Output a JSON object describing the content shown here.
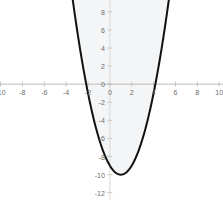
{
  "chart_data": {
    "type": "line",
    "title": "",
    "subtitle": "",
    "xlabel": "",
    "ylabel": "",
    "grid": false,
    "legend": false,
    "legend_position": "none",
    "xlim": [
      -10.05,
      10.35
    ],
    "ylim": [
      -12.8,
      9.3
    ],
    "x_ticks": [
      -10,
      -8,
      -6,
      -4,
      -2,
      0,
      2,
      4,
      6,
      8,
      10
    ],
    "x_tick_labels": [
      "-10",
      "-8",
      "-6",
      "-4",
      "-2",
      "0",
      "2",
      "4",
      "6",
      "8",
      "10"
    ],
    "y_ticks": [
      8,
      6,
      4,
      2,
      0,
      -2,
      -4,
      -6,
      -8,
      -10,
      -12
    ],
    "y_tick_labels": [
      "8",
      "6",
      "4",
      "2",
      "0",
      "-2",
      "-4",
      "-6",
      "-8",
      "-10",
      "-12"
    ],
    "series": [
      {
        "name": "parabola",
        "equation": "y = x^2 - 2x - 9",
        "type": "line",
        "color": "#111111",
        "line_width": 2,
        "vertex": [
          1,
          -10
        ],
        "roots": [
          -2.16,
          4.16
        ],
        "y_intercept": -9,
        "x": [
          -2.6,
          -2.4,
          -2.2,
          -2.0,
          -1.8,
          -1.6,
          -1.4,
          -1.2,
          -1.0,
          -0.8,
          -0.6,
          -0.4,
          -0.2,
          0.0,
          0.2,
          0.4,
          0.6,
          0.8,
          1.0,
          1.2,
          1.4,
          1.6,
          1.8,
          2.0,
          2.2,
          2.4,
          2.6,
          2.8,
          3.0,
          3.2,
          3.4,
          3.6,
          3.8,
          4.0,
          4.2,
          4.4,
          4.6,
          4.8,
          5.0,
          5.2,
          5.4
        ],
        "values": [
          2.96,
          1.56,
          0.24,
          -1.0,
          -2.16,
          -3.24,
          -4.24,
          -5.16,
          -6.0,
          -6.76,
          -7.44,
          -8.04,
          -8.56,
          -9.0,
          -9.36,
          -9.64,
          -9.84,
          -9.96,
          -10.0,
          -9.96,
          -9.84,
          -9.64,
          -9.36,
          -9.0,
          -8.56,
          -8.04,
          -7.44,
          -6.76,
          -6.0,
          -5.16,
          -4.24,
          -3.24,
          -2.16,
          -1.0,
          0.24,
          1.56,
          2.96,
          4.44,
          6.0,
          7.64,
          9.36
        ]
      }
    ],
    "fill": {
      "description": "interior-of-parabola-shaded",
      "color": "#f4f5f6",
      "region": "above curve, bounded by plot area"
    },
    "axes": {
      "x_axis_color": "#b9b9b9",
      "y_axis_color": "#d8d8d8",
      "tick_color": "#c6c6c6",
      "label_color": "#6b6b6b",
      "origin": [
        0,
        0
      ]
    }
  }
}
